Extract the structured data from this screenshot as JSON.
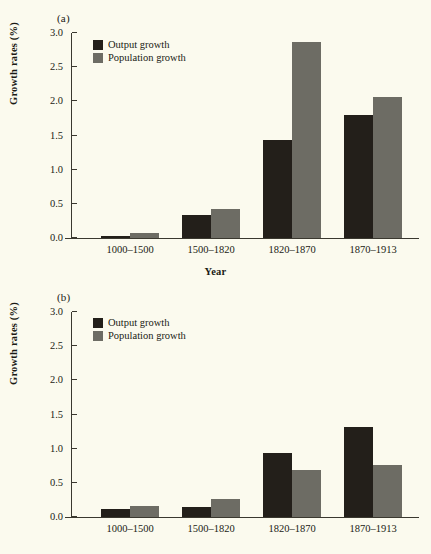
{
  "figure": {
    "background_color": "#fbfaee",
    "output_color": "#231f1a",
    "population_color": "#6d6c64"
  },
  "panels": [
    {
      "label": "(a)",
      "legend": [
        {
          "name": "output-growth",
          "label": "Output growth"
        },
        {
          "name": "population-growth",
          "label": "Population growth"
        }
      ]
    },
    {
      "label": "(b)",
      "legend": [
        {
          "name": "output-growth",
          "label": "Output growth"
        },
        {
          "name": "population-growth",
          "label": "Population growth"
        }
      ]
    }
  ],
  "chart_data": [
    {
      "type": "bar",
      "panel": "(a)",
      "title": "",
      "xlabel": "Year",
      "ylabel": "Growth rates (%)",
      "categories": [
        "1000–1500",
        "1500–1820",
        "1820–1870",
        "1870–1913"
      ],
      "series": [
        {
          "name": "Output growth",
          "color": "#231f1a",
          "values": [
            0.03,
            0.34,
            1.43,
            1.8
          ]
        },
        {
          "name": "Population growth",
          "color": "#6d6c64",
          "values": [
            0.07,
            0.43,
            2.87,
            2.06
          ]
        }
      ],
      "ylim": [
        0.0,
        3.0
      ],
      "yticks": [
        "0.0",
        "0.5",
        "1.0",
        "1.5",
        "2.0",
        "2.5",
        "3.0"
      ],
      "ytick_values": [
        0.0,
        0.5,
        1.0,
        1.5,
        2.0,
        2.5,
        3.0
      ],
      "grid": false,
      "legend_position": "top-left"
    },
    {
      "type": "bar",
      "panel": "(b)",
      "title": "",
      "xlabel": "",
      "ylabel": "Growth rates (%)",
      "categories": [
        "1000–1500",
        "1500–1820",
        "1820–1870",
        "1870–1913"
      ],
      "series": [
        {
          "name": "Output growth",
          "color": "#231f1a",
          "values": [
            0.12,
            0.14,
            0.94,
            1.31
          ]
        },
        {
          "name": "Population growth",
          "color": "#6d6c64",
          "values": [
            0.16,
            0.26,
            0.69,
            0.76
          ]
        }
      ],
      "ylim": [
        0.0,
        3.0
      ],
      "yticks": [
        "0.0",
        "0.5",
        "1.0",
        "1.5",
        "2.0",
        "2.5",
        "3.0"
      ],
      "ytick_values": [
        0.0,
        0.5,
        1.0,
        1.5,
        2.0,
        2.5,
        3.0
      ],
      "grid": false,
      "legend_position": "top-left"
    }
  ]
}
